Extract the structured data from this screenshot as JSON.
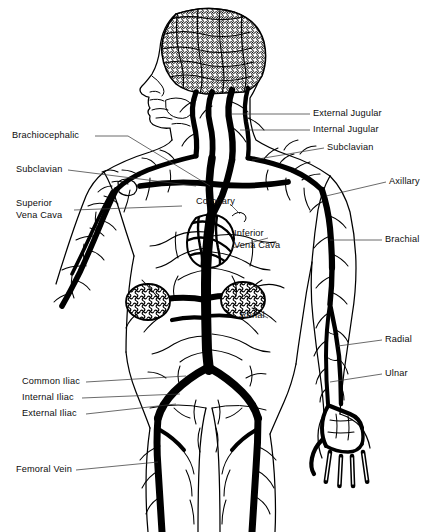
{
  "figure": {
    "type": "anatomical-line-diagram",
    "width": 438,
    "height": 532,
    "background_color": "#ffffff",
    "ink_color": "#000000",
    "leader_line_color": "#3a3a3a",
    "view": "anterior"
  },
  "labels": {
    "external_jugular": "External Jugular",
    "internal_jugular": "Internal Jugular",
    "subclavian_right": "Subclavian",
    "axillary": "Axillary",
    "brachial": "Brachial",
    "radial": "Radial",
    "ulnar": "Ulnar",
    "brachiocephalic": "Brachiocephalic",
    "subclavian_left": "Subclavian",
    "superior_vena_cava_l1": "Superior",
    "superior_vena_cava_l2": "Vena Cava",
    "common_iliac": "Common Iliac",
    "internal_iliac": "Internal Iliac",
    "external_iliac": "External Iliac",
    "femoral_vein": "Femoral Vein",
    "coronary": "Coronary",
    "inferior_vena_cava_l1": "Inferior",
    "inferior_vena_cava_l2": "Vena Cava",
    "renal": "Renal"
  },
  "anatomy_parts": {
    "brain": "brain-vascular-plexus",
    "head": "head-profile",
    "neck_vessels": "jugular-vessel-group",
    "heart": "heart",
    "kidney_left": "kidney-left",
    "kidney_right": "kidney-right",
    "vena_cava_trunk": "vena-cava-trunk",
    "arm_right": "right-arm-vessels",
    "arm_left": "left-arm-vessels",
    "hand_right": "right-hand-vessels",
    "leg_left": "left-leg-vessels",
    "leg_right": "right-leg-vessels",
    "body_outline": "body-outline"
  }
}
